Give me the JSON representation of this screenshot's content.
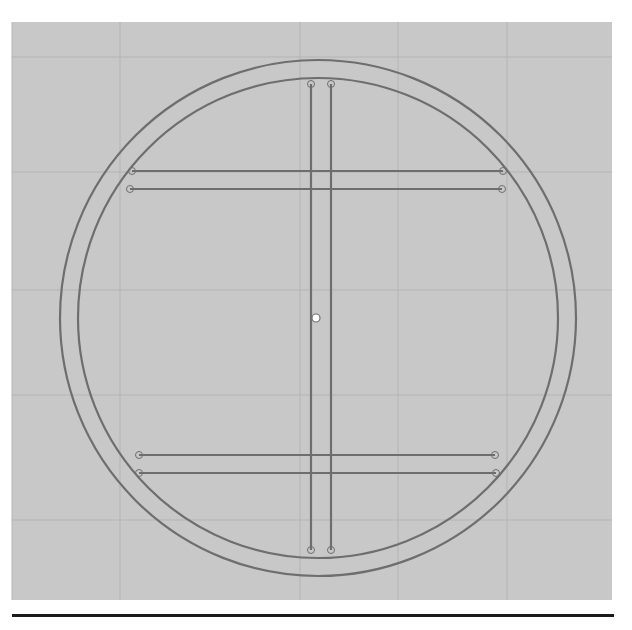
{
  "diagram": {
    "type": "cad-sketch",
    "colors": {
      "page": "#ffffff",
      "panel": "#c8c8c8",
      "grid": "#b4b4b4",
      "stroke": "#6e6e6e",
      "rule": "#1a1a1a",
      "center_point_fill": "#ffffff"
    },
    "panel": {
      "x": 12,
      "y": 22,
      "w": 600,
      "h": 578
    },
    "grid": {
      "vertical_x": [
        12,
        120,
        300,
        398,
        507
      ],
      "horizontal_y": [
        57,
        172,
        290,
        395,
        520
      ]
    },
    "outer_circle": {
      "cx": 318,
      "cy": 318,
      "r": 258
    },
    "inner_circle": {
      "cx": 318,
      "cy": 318,
      "r": 240
    },
    "vertical_members": [
      {
        "x": 311,
        "y1": 84,
        "y2": 550
      },
      {
        "x": 331,
        "y1": 84,
        "y2": 550
      }
    ],
    "horizontal_members": [
      {
        "y": 171,
        "x1": 132,
        "x2": 503
      },
      {
        "y": 189,
        "x1": 130,
        "x2": 502
      },
      {
        "y": 455,
        "x1": 139,
        "x2": 495
      },
      {
        "y": 473,
        "x1": 139,
        "x2": 496
      }
    ],
    "center_point": {
      "x": 316,
      "y": 318
    }
  }
}
